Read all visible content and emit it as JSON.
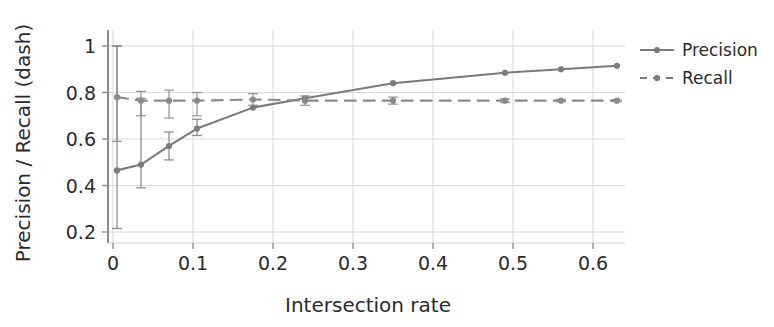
{
  "chart_data": {
    "type": "line",
    "title": "",
    "subtitle": "",
    "xlabel": "Intersection rate",
    "ylabel": "Precision / Recall (dash)",
    "xlim": [
      -0.02,
      0.64
    ],
    "ylim": [
      0.18,
      1.04
    ],
    "xticks": [
      0,
      0.1,
      0.2,
      0.3,
      0.4,
      0.5,
      0.6
    ],
    "xticklabels": [
      "0",
      "0.1",
      "0.2",
      "0.3",
      "0.4",
      "0.5",
      "0.6"
    ],
    "yticks": [
      0.2,
      0.4,
      0.6,
      0.8,
      1
    ],
    "yticklabels": [
      "0.2",
      "0.4",
      "0.6",
      "0.8",
      "1"
    ],
    "grid": true,
    "grid_color": "#d9d9d9",
    "legend_position": "right-outside",
    "x": [
      0.005,
      0.035,
      0.07,
      0.105,
      0.175,
      0.24,
      0.35,
      0.49,
      0.56,
      0.63
    ],
    "series": [
      {
        "name": "Precision",
        "style": "solid",
        "color": "#7b7b7b",
        "marker": "circle",
        "values": [
          0.465,
          0.49,
          0.57,
          0.645,
          0.735,
          0.775,
          0.84,
          0.885,
          0.9,
          0.915
        ],
        "err_low": [
          0.25,
          0.1,
          0.06,
          0.03,
          0.0,
          0.0,
          0.0,
          0.0,
          0.0,
          0.0
        ],
        "err_high": [
          0.535,
          0.285,
          0.06,
          0.04,
          0.0,
          0.0,
          0.0,
          0.0,
          0.0,
          0.0
        ]
      },
      {
        "name": "Recall",
        "style": "dashed",
        "color": "#8a8a8a",
        "marker": "circle",
        "values": [
          0.78,
          0.765,
          0.765,
          0.765,
          0.77,
          0.765,
          0.765,
          0.765,
          0.765,
          0.765
        ],
        "err_low": [
          0.19,
          0.065,
          0.075,
          0.065,
          0.025,
          0.02,
          0.015,
          0.008,
          0.005,
          0.004
        ],
        "err_high": [
          0.22,
          0.04,
          0.045,
          0.035,
          0.025,
          0.02,
          0.015,
          0.008,
          0.005,
          0.004
        ]
      }
    ],
    "legend": [
      {
        "label": "Precision",
        "style": "solid"
      },
      {
        "label": "Recall",
        "style": "dashed"
      }
    ],
    "annotations": []
  },
  "axes": {
    "x_title": "Intersection rate",
    "y_title": "Precision / Recall (dash)"
  }
}
